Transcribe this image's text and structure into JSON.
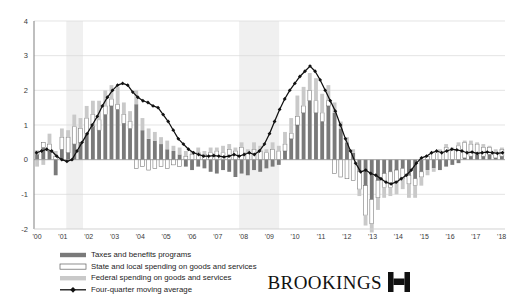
{
  "chart_data": {
    "type": "bar",
    "title": "",
    "subtitle": "",
    "xlabel": "",
    "ylabel": "",
    "ylim": [
      -2,
      4
    ],
    "yticks": [
      -2,
      -1,
      0,
      1,
      2,
      3,
      4
    ],
    "ytick_labels": [
      "-2",
      "-1",
      "0",
      "1",
      "2",
      "3",
      "4"
    ],
    "xtick_labels": [
      "'00",
      "'01",
      "'02",
      "'03",
      "'04",
      "'05",
      "'06",
      "'07",
      "'08",
      "'09",
      "'10",
      "'11",
      "'12",
      "'13",
      "'14",
      "'15",
      "'16",
      "'17",
      "'18"
    ],
    "xtick_years": [
      2000,
      2001,
      2002,
      2003,
      2004,
      2005,
      2006,
      2007,
      2008,
      2009,
      2010,
      2011,
      2012,
      2013,
      2014,
      2015,
      2016,
      2017,
      2018
    ],
    "grid": true,
    "grid_axis": "y",
    "legend_position": "below-left",
    "stacked": true,
    "bar_frequency": "quarterly",
    "x_start": 2000.0,
    "x_end": 2018.25,
    "recession_bands": [
      {
        "start": 2001.25,
        "end": 2001.9,
        "label": "2001 recession"
      },
      {
        "start": 2007.95,
        "end": 2009.5,
        "label": "2007-09 recession"
      }
    ],
    "recession_band_color": "#f0f0f0",
    "series": [
      {
        "name": "Taxes and benefits programs",
        "key": "taxes",
        "color": "#7a7a7a",
        "style": "filled-dark",
        "values": [
          0.15,
          0.35,
          0.25,
          -0.45,
          0.3,
          0.2,
          0.45,
          0.5,
          0.75,
          0.95,
          0.85,
          1.3,
          1.55,
          1.45,
          1.05,
          0.9,
          1.6,
          0.85,
          0.6,
          0.55,
          0.45,
          0.3,
          0.25,
          0.15,
          -0.2,
          -0.3,
          -0.2,
          -0.25,
          -0.35,
          -0.4,
          -0.3,
          -0.35,
          -0.5,
          -0.4,
          -0.45,
          -0.3,
          -0.35,
          -0.25,
          -0.2,
          -0.15,
          0.25,
          0.6,
          1.0,
          1.35,
          1.7,
          1.35,
          1.1,
          1.55,
          1.35,
          0.9,
          0.5,
          0.2,
          -0.35,
          -0.75,
          -1.15,
          -0.6,
          -0.4,
          -0.35,
          -0.3,
          -0.25,
          -0.45,
          -0.55,
          -0.35,
          -0.3,
          -0.25,
          -0.3,
          -0.2,
          -0.15,
          -0.1,
          0.05,
          0.1,
          0.15,
          0.1,
          0.15,
          0.05,
          0.1
        ]
      },
      {
        "name": "State and local spending on goods and services",
        "key": "state_local",
        "color": "#ffffff",
        "style": "outlined-white",
        "values": [
          0.1,
          0.15,
          0.2,
          0.1,
          0.35,
          0.45,
          0.5,
          0.4,
          0.45,
          0.35,
          0.3,
          0.25,
          0.2,
          0.15,
          0.25,
          0.2,
          -0.25,
          -0.2,
          -0.3,
          -0.25,
          -0.2,
          -0.25,
          -0.15,
          -0.2,
          0.1,
          0.15,
          0.2,
          0.15,
          0.2,
          0.25,
          0.2,
          0.3,
          0.25,
          0.35,
          0.2,
          0.3,
          0.25,
          0.2,
          0.3,
          0.25,
          0.2,
          0.15,
          0.25,
          0.2,
          0.3,
          0.35,
          0.25,
          0.15,
          -0.4,
          -0.5,
          -0.55,
          -0.6,
          -0.5,
          -0.85,
          -0.7,
          -0.5,
          -0.4,
          -0.45,
          -0.35,
          -0.3,
          -0.25,
          -0.2,
          -0.15,
          0.1,
          0.2,
          0.25,
          0.35,
          0.3,
          0.4,
          0.45,
          0.35,
          0.3,
          0.25,
          0.2,
          0.15,
          0.2
        ]
      },
      {
        "name": "Federal spending on goods and services",
        "key": "federal",
        "color": "#c9c9c9",
        "style": "filled-light",
        "values": [
          -0.2,
          -0.15,
          0.3,
          0.15,
          0.25,
          0.2,
          0.35,
          0.3,
          0.35,
          0.4,
          0.55,
          0.45,
          0.4,
          0.5,
          0.35,
          0.3,
          0.4,
          0.35,
          0.3,
          0.25,
          0.2,
          0.25,
          0.15,
          0.2,
          0.15,
          0.1,
          0.15,
          0.1,
          0.15,
          0.1,
          0.2,
          0.15,
          0.1,
          0.15,
          0.1,
          0.2,
          0.15,
          0.1,
          0.2,
          0.15,
          0.35,
          0.45,
          0.6,
          0.55,
          0.5,
          0.65,
          0.55,
          0.45,
          0.3,
          0.2,
          0.15,
          0.1,
          -0.2,
          -0.3,
          -0.25,
          -0.35,
          -0.3,
          -0.25,
          -0.35,
          -0.3,
          -0.4,
          -0.35,
          -0.25,
          -0.15,
          -0.1,
          0.05,
          0.1,
          0.05,
          0.1,
          0.05,
          0.1,
          0.05,
          0.1,
          0.05,
          0.1,
          0.05
        ]
      }
    ],
    "moving_average": {
      "name": "Four-quarter moving average",
      "color": "#111111",
      "marker": "diamond",
      "values": [
        0.2,
        0.25,
        0.3,
        0.25,
        0.1,
        0.0,
        -0.05,
        0.0,
        0.25,
        0.5,
        0.75,
        1.0,
        1.25,
        1.55,
        1.8,
        2.0,
        2.15,
        2.2,
        2.15,
        1.95,
        1.8,
        1.7,
        1.65,
        1.55,
        1.5,
        1.3,
        1.1,
        0.85,
        0.6,
        0.45,
        0.3,
        0.2,
        0.15,
        0.1,
        0.1,
        0.12,
        0.1,
        0.08,
        0.1,
        0.15,
        0.1,
        0.15,
        0.2,
        0.15,
        0.25,
        0.45,
        0.75,
        1.1,
        1.45,
        1.75,
        2.0,
        2.2,
        2.4,
        2.55,
        2.7,
        2.55,
        2.3,
        2.0,
        1.7,
        1.4,
        1.0,
        0.6,
        0.25,
        -0.1,
        -0.35,
        -0.3,
        -0.4,
        -0.45,
        -0.55,
        -0.65,
        -0.7,
        -0.65,
        -0.55,
        -0.45,
        -0.3,
        -0.1,
        0.05,
        0.1,
        0.2,
        0.25,
        0.2,
        0.25,
        0.3,
        0.28,
        0.25,
        0.2,
        0.22,
        0.18,
        0.2,
        0.22,
        0.2,
        0.18,
        0.2
      ]
    }
  },
  "legend": {
    "items": [
      {
        "label": "Taxes and benefits programs",
        "swatch": "dark-bar",
        "color": "#7a7a7a"
      },
      {
        "label": "State and local spending on goods and services",
        "swatch": "outlined-bar",
        "color": "#ffffff"
      },
      {
        "label": "Federal spending on goods and services",
        "swatch": "light-bar",
        "color": "#c9c9c9"
      },
      {
        "label": "Four-quarter moving average",
        "swatch": "line-marker",
        "color": "#111111"
      }
    ]
  },
  "branding": {
    "wordmark": "BROOKINGS",
    "mark": "H"
  },
  "axes": {
    "y_axis_color": "#8a8a8a",
    "grid_color": "#d8d8d8",
    "baseline_color": "#9a9a9a"
  }
}
